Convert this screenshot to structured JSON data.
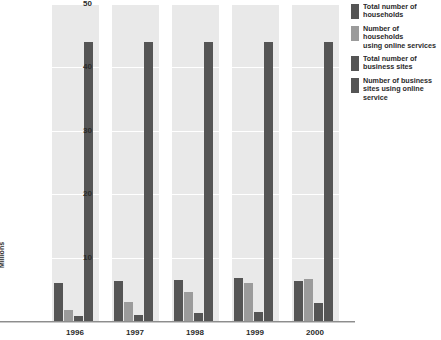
{
  "chart_data": {
    "type": "bar",
    "title": "",
    "subtitle": "",
    "xlabel": "",
    "ylabel": "Millions",
    "categories": [
      "1996",
      "1997",
      "1998",
      "1999",
      "2000"
    ],
    "ylim": [
      0,
      50
    ],
    "yticks": [
      10,
      20,
      30,
      40,
      50
    ],
    "ytick_labels": [
      "10",
      "20",
      "30",
      "40",
      "50"
    ],
    "grid": true,
    "grid_axis": "y",
    "legend_position": "right",
    "series": [
      {
        "name": "Total number of\nhouseholds",
        "color": "#555555",
        "values": [
          6.0,
          6.3,
          6.5,
          6.8,
          6.3
        ]
      },
      {
        "name": "Number of households\nusing online services",
        "color": "#9b9b9b",
        "values": [
          1.8,
          3.0,
          4.5,
          6.0,
          6.6
        ]
      },
      {
        "name": "Total number of\nbusiness sites",
        "color": "#555555",
        "values": [
          0.8,
          1.0,
          1.2,
          1.5,
          2.8
        ]
      },
      {
        "name": "Number of business\nsites using online service",
        "color": "#555555",
        "values": [
          44.0,
          44.0,
          44.0,
          44.0,
          44.0
        ]
      }
    ]
  },
  "legend": {
    "items": [
      {
        "label": "Total number of\nhouseholds",
        "color": "#555555"
      },
      {
        "label": "Number of households\nusing online services",
        "color": "#9b9b9b"
      },
      {
        "label": "Total number of\nbusiness sites",
        "color": "#555555"
      },
      {
        "label": "Number of business\nsites using online service",
        "color": "#555555"
      }
    ]
  },
  "axis": {
    "y_title": "Millions",
    "y_tick_50": "50",
    "y_tick_40": "40",
    "y_tick_30": "30",
    "y_tick_20": "20",
    "y_tick_10": "10",
    "x_tick_0": "1996",
    "x_tick_1": "1997",
    "x_tick_2": "1998",
    "x_tick_3": "1999",
    "x_tick_4": "2000"
  },
  "colors": {
    "panel_band": "#e9e9e9",
    "gridline": "#ffffff",
    "bar_dark": "#555555",
    "bar_light": "#9b9b9b",
    "text": "#2b2b2b",
    "axis_line": "#8d8d8d",
    "background": "#ffffff"
  }
}
